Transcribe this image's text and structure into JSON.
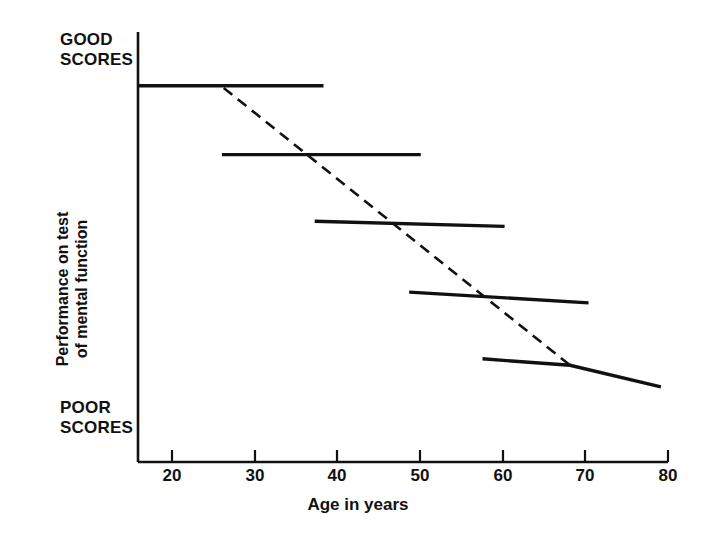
{
  "figure": {
    "background_color": "#ffffff",
    "ink_color": "#111111"
  },
  "labels": {
    "good_scores": "GOOD\nSCORES",
    "poor_scores": "POOR\nSCORES",
    "y_axis_title": "Performance on test\nof mental function",
    "x_axis_title": "Age in years"
  },
  "chart_data": {
    "type": "line",
    "title": "",
    "subtitle": "",
    "xlabel": "Age in years",
    "ylabel": "Performance on test of mental function",
    "xlim": [
      20,
      80
    ],
    "ylim": [
      0,
      100
    ],
    "grid": false,
    "legend": "none",
    "xticks": [
      20,
      30,
      40,
      50,
      60,
      70,
      80
    ],
    "xticklabels": [
      "20",
      "30",
      "40",
      "50",
      "60",
      "70",
      "80"
    ],
    "yticks": [],
    "yticklabels": [
      "POOR SCORES",
      "GOOD SCORES"
    ],
    "y_axis_annotations": [
      {
        "position": "top",
        "text": "GOOD SCORES"
      },
      {
        "position": "bottom",
        "text": "POOR SCORES"
      }
    ],
    "series": [
      {
        "name": "cohort-segment-1",
        "style": "solid",
        "points": [
          {
            "x": 20.0,
            "y": 87.5
          },
          {
            "x": 41.0,
            "y": 87.5
          }
        ]
      },
      {
        "name": "cohort-segment-2",
        "style": "solid",
        "points": [
          {
            "x": 29.5,
            "y": 71.5
          },
          {
            "x": 52.0,
            "y": 71.5
          }
        ]
      },
      {
        "name": "cohort-segment-3",
        "style": "solid",
        "points": [
          {
            "x": 40.0,
            "y": 56.0
          },
          {
            "x": 61.5,
            "y": 54.8
          }
        ]
      },
      {
        "name": "cohort-segment-4",
        "style": "solid",
        "points": [
          {
            "x": 50.7,
            "y": 39.5
          },
          {
            "x": 71.0,
            "y": 37.0
          }
        ]
      },
      {
        "name": "cohort-segment-5",
        "style": "solid",
        "points": [
          {
            "x": 59.0,
            "y": 24.0
          },
          {
            "x": 68.9,
            "y": 22.5
          },
          {
            "x": 79.2,
            "y": 17.5
          }
        ]
      },
      {
        "name": "longitudinal-trend",
        "style": "dashed",
        "points": [
          {
            "x": 29.7,
            "y": 87.0
          },
          {
            "x": 68.9,
            "y": 22.5
          }
        ]
      }
    ]
  }
}
